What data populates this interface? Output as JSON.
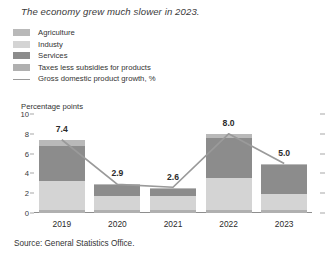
{
  "title": "The economy grew much slower in 2023.",
  "unit_label": "Percentage points",
  "source": "Source: General Statistics Office.",
  "legend": {
    "items": [
      {
        "label": "Agriculture",
        "color": "#b9b9b9",
        "marker": "swatch"
      },
      {
        "label": "Industy",
        "color": "#d4d4d4",
        "marker": "swatch"
      },
      {
        "label": "Services",
        "color": "#8c8c8c",
        "marker": "swatch"
      },
      {
        "label": "Taxes less subsidies for products",
        "color": "#b0b0b0",
        "marker": "swatch"
      },
      {
        "label": "Gross domestic product growth, %",
        "color": "#9a9a9a",
        "marker": "line"
      }
    ]
  },
  "chart_data": {
    "type": "bar",
    "subtype": "stacked-bar-with-line-overlay",
    "title": "The economy grew much slower in 2023.",
    "xlabel": "",
    "ylabel": "Percentage points",
    "ylim": [
      0,
      10
    ],
    "yticks": [
      0,
      2,
      4,
      6,
      8,
      10
    ],
    "ytick_labels": [
      "0",
      "2",
      "4",
      "6",
      "8",
      "10"
    ],
    "grid": false,
    "legend_position": "top-left",
    "categories": [
      "2019",
      "2020",
      "2021",
      "2022",
      "2023"
    ],
    "series": [
      {
        "name": "Taxes less subsidies for products",
        "color": "#b0b0b0",
        "values": [
          0.35,
          0.3,
          0.3,
          0.35,
          0.35
        ]
      },
      {
        "name": "Industy",
        "color": "#d4d4d4",
        "values": [
          2.85,
          1.4,
          1.4,
          3.15,
          1.55
        ]
      },
      {
        "name": "Services",
        "color": "#8c8c8c",
        "values": [
          3.6,
          1.1,
          0.75,
          4.1,
          2.95
        ]
      },
      {
        "name": "Agriculture",
        "color": "#b9b9b9",
        "values": [
          0.6,
          0.15,
          0.1,
          0.4,
          0.15
        ]
      }
    ],
    "line_series": {
      "name": "Gross domestic product growth, %",
      "color": "#9a9a9a",
      "values": [
        7.4,
        2.9,
        2.6,
        8.0,
        5.0
      ],
      "data_labels": [
        "7.4",
        "2.9",
        "2.6",
        "8.0",
        "5.0"
      ]
    },
    "bar_totals": [
      7.4,
      2.9,
      2.6,
      8.0,
      5.0
    ]
  },
  "axis": {
    "right_ticks": [
      0,
      2,
      4,
      6,
      8,
      10
    ]
  }
}
